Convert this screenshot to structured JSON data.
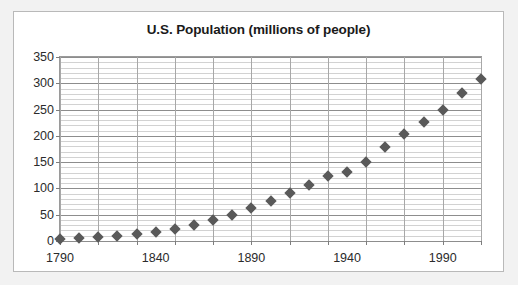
{
  "chart": {
    "title": "U.S. Population (millions of people)"
  },
  "chart_data": {
    "type": "scatter",
    "title": "U.S. Population (millions of people)",
    "xlabel": "",
    "ylabel": "",
    "xlim": [
      1790,
      2010
    ],
    "ylim": [
      0,
      350
    ],
    "yticks": [
      0,
      50,
      100,
      150,
      200,
      250,
      300,
      350
    ],
    "ytick_labels": [
      "0",
      "50",
      "100",
      "150",
      "200",
      "250",
      "300",
      "350"
    ],
    "y_minor_step": 10,
    "xticks": [
      1790,
      1840,
      1890,
      1940,
      1990
    ],
    "xtick_labels": [
      "1790",
      "1840",
      "1890",
      "1940",
      "1990"
    ],
    "x_gridline_step": 20,
    "grid": true,
    "legend": "none",
    "marker": "diamond",
    "marker_color": "#595959",
    "x": [
      1790,
      1800,
      1810,
      1820,
      1830,
      1840,
      1850,
      1860,
      1870,
      1880,
      1890,
      1900,
      1910,
      1920,
      1930,
      1940,
      1950,
      1960,
      1970,
      1980,
      1990,
      2000,
      2010
    ],
    "values": [
      4,
      5,
      7,
      10,
      13,
      17,
      23,
      31,
      39,
      50,
      63,
      76,
      92,
      106,
      123,
      132,
      151,
      179,
      203,
      227,
      249,
      281,
      309
    ]
  }
}
